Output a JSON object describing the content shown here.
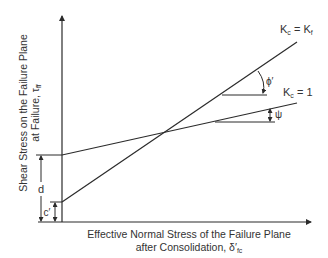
{
  "diagram": {
    "type": "shear-strength-envelope",
    "y_axis": {
      "label_line1": "Shear Stress on the Failure Plane",
      "label_line2": "at Failure, τ",
      "label_subscript": "ff"
    },
    "x_axis": {
      "label_line1": "Effective Normal Stress of the Failure Plane",
      "label_line2": "after Consolidation, δ′",
      "label_subscript": "fc"
    },
    "lines": [
      {
        "id": "kc-kf",
        "label_main": "K",
        "label_sub1": "c",
        "label_eq": " = K",
        "label_sub2": "f",
        "angle_symbol": "ϕ′"
      },
      {
        "id": "kc-1",
        "label_main": "K",
        "label_sub1": "c",
        "label_eq": " = 1",
        "angle_symbol": "ψ"
      }
    ],
    "intercepts": {
      "d_label": "d",
      "c_label": "c′"
    },
    "colors": {
      "line": "#2b2b2b",
      "text": "#333333",
      "background": "#ffffff"
    }
  }
}
